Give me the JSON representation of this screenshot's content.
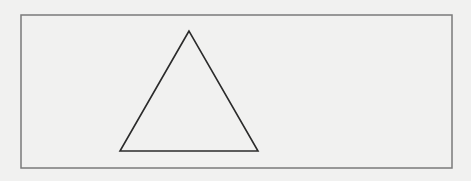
{
  "diagram": {
    "background": "#f1f1f0",
    "frame": {
      "x": 21,
      "y": 15,
      "width": 431,
      "height": 153,
      "stroke": "#7a7a7a",
      "stroke_width": 1.5
    },
    "shapes": [
      {
        "type": "triangle",
        "points": [
          [
            189,
            31
          ],
          [
            120,
            151
          ],
          [
            258,
            151
          ]
        ],
        "stroke": "#2b2b2b",
        "stroke_width": 1.6,
        "fill": "none"
      }
    ]
  }
}
